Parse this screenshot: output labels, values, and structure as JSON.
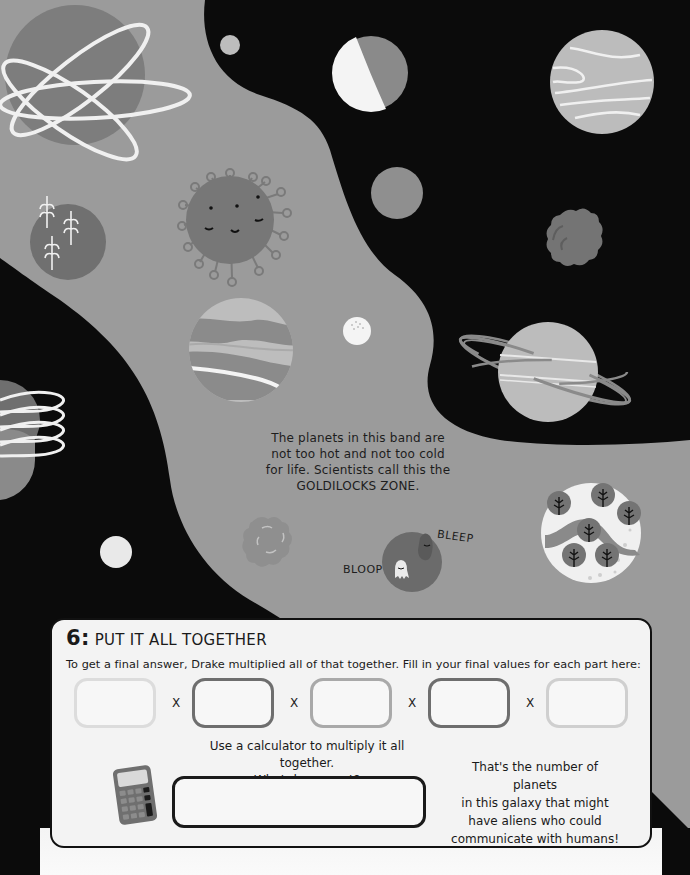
{
  "illustration": {
    "description_text": "The planets in this band are not too hot and not too cold for life. Scientists call this the GOLDILOCKS ZONE.",
    "lines": [
      "The planets in this band are",
      "not too hot and not too cold",
      "for life. Scientists call this the",
      "GOLDILOCKS ZONE."
    ],
    "speech": {
      "bleep": "BLEEP",
      "bloop": "BLOOP"
    },
    "colors": {
      "space": "#0b0b0b",
      "band": "#9b9b9b",
      "planet_mid": "#7a7a7a",
      "planet_light": "#bdbdbd",
      "white": "#f2f2f2"
    }
  },
  "section": {
    "number": "6:",
    "title": "PUT IT ALL TOGETHER",
    "instruction": "To get a final answer, Drake multiplied all of that together. Fill in your final values for each part here:",
    "operator": "X",
    "boxes": [
      {
        "border": "#dcdcdc",
        "value": ""
      },
      {
        "border": "#6e6e6e",
        "value": ""
      },
      {
        "border": "#a9a9a9",
        "value": ""
      },
      {
        "border": "#6e6e6e",
        "value": ""
      },
      {
        "border": "#cfcfcf",
        "value": ""
      }
    ],
    "calculator_prompt_line1": "Use a calculator to multiply it all together.",
    "calculator_prompt_line2": "What do you get?",
    "answer_value": "",
    "result_note_lines": [
      "That's the number of planets",
      "in this galaxy that might",
      "have aliens who could",
      "communicate with humans!"
    ]
  }
}
